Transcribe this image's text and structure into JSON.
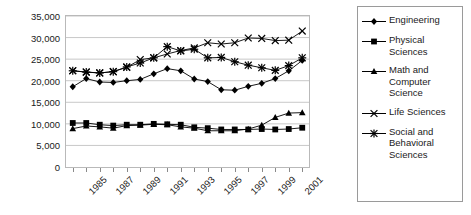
{
  "chart_data": {
    "type": "line",
    "title": "",
    "xlabel": "",
    "ylabel": "First-Year Graduate Enrollment",
    "x": [
      1985,
      1986,
      1987,
      1988,
      1989,
      1990,
      1991,
      1992,
      1993,
      1994,
      1995,
      1996,
      1997,
      1998,
      1999,
      2000,
      2001,
      2002
    ],
    "xtick_labels": [
      "1985",
      "1987",
      "1989",
      "1991",
      "1993",
      "1995",
      "1997",
      "1999",
      "2001"
    ],
    "xtick_values": [
      1985,
      1987,
      1989,
      1991,
      1993,
      1995,
      1997,
      1999,
      2001
    ],
    "ytick_labels": [
      "0",
      "5,000",
      "10,000",
      "15,000",
      "20,000",
      "25,000",
      "30,000",
      "35,000"
    ],
    "ytick_values": [
      0,
      5000,
      10000,
      15000,
      20000,
      25000,
      30000,
      35000
    ],
    "ylim": [
      0,
      35000
    ],
    "xlim": [
      1984.5,
      2002.5
    ],
    "grid": "horizontal",
    "legend_position": "right-outside",
    "series": [
      {
        "name": "Engineering",
        "marker": "diamond",
        "color": "#000000",
        "values": [
          18600,
          20500,
          19700,
          19600,
          20000,
          20300,
          21600,
          22800,
          22300,
          20400,
          19800,
          17900,
          17800,
          18700,
          19400,
          20500,
          22300,
          24700
        ]
      },
      {
        "name": "Physical Sciences",
        "marker": "square",
        "color": "#000000",
        "values": [
          10200,
          10200,
          9800,
          9600,
          9800,
          9800,
          10000,
          9900,
          9800,
          9200,
          9000,
          8700,
          8700,
          8700,
          8800,
          8700,
          8800,
          9100
        ]
      },
      {
        "name": "Math and Computer Science",
        "marker": "triangle",
        "color": "#000000",
        "values": [
          8900,
          9500,
          9300,
          9000,
          9600,
          9700,
          9900,
          9800,
          9300,
          9000,
          8400,
          8400,
          8400,
          8800,
          9700,
          11500,
          12500,
          12600
        ]
      },
      {
        "name": "Life Sciences",
        "marker": "x",
        "color": "#000000",
        "values": [
          22300,
          22000,
          21800,
          22100,
          23100,
          24900,
          25300,
          26200,
          27000,
          27600,
          28800,
          28500,
          28800,
          29900,
          29800,
          29300,
          29400,
          31500
        ]
      },
      {
        "name": "Social and Behavioral Sciences",
        "marker": "star",
        "color": "#000000",
        "values": [
          22300,
          22000,
          21800,
          22100,
          23200,
          24100,
          25300,
          27900,
          26900,
          27300,
          25300,
          25400,
          24400,
          23600,
          23000,
          22400,
          23500,
          25300
        ]
      }
    ]
  },
  "legend": {
    "items": [
      {
        "label": "Engineering",
        "marker": "diamond-marker-icon"
      },
      {
        "label": "Physical Sciences",
        "marker": "square-marker-icon"
      },
      {
        "label": "Math and Computer Science",
        "marker": "triangle-marker-icon"
      },
      {
        "label": "Life Sciences",
        "marker": "x-marker-icon"
      },
      {
        "label": "Social and Behavioral Sciences",
        "marker": "star-marker-icon"
      }
    ]
  },
  "colors": {
    "plot_border": "#b9b9b9",
    "gridline": "#c8c8c8",
    "legend_border": "#9a9a9a",
    "text": "#1a1a1a",
    "series": "#000000",
    "background": "#ffffff"
  }
}
